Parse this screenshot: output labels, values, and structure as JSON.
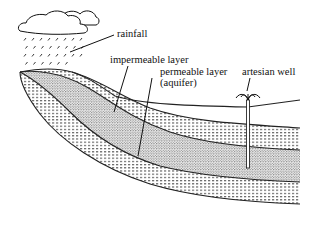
{
  "diagram": {
    "labels": {
      "rainfall": "rainfall",
      "impermeable": "impermeable layer",
      "permeable_line1": "permeable layer",
      "permeable_line2": "(aquifer)",
      "well": "artesian well"
    },
    "layers": [
      {
        "name": "impermeable layer (upper)",
        "pattern": "dashed-lines"
      },
      {
        "name": "permeable layer (aquifer)",
        "pattern": "stippled"
      },
      {
        "name": "impermeable layer (lower)",
        "pattern": "dashed-lines"
      }
    ],
    "colors": {
      "ink": "#111111",
      "background": "#ffffff"
    }
  }
}
